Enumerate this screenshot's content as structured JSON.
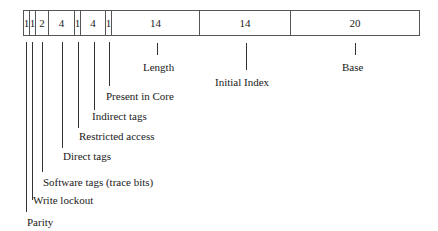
{
  "diagram": {
    "title": "",
    "fields": [
      {
        "bits": "1",
        "name": "Parity"
      },
      {
        "bits": "1",
        "name": "Write lockout"
      },
      {
        "bits": "2",
        "name": "Software tags (trace bits)"
      },
      {
        "bits": "4",
        "name": "Direct tags"
      },
      {
        "bits": "1",
        "name": "Restricted access"
      },
      {
        "bits": "4",
        "name": "Indirect tags"
      },
      {
        "bits": "1",
        "name": "Present in Core"
      },
      {
        "bits": "14",
        "name": "Length"
      },
      {
        "bits": "14",
        "name": "Initial Index"
      },
      {
        "bits": "20",
        "name": "Base"
      }
    ]
  }
}
